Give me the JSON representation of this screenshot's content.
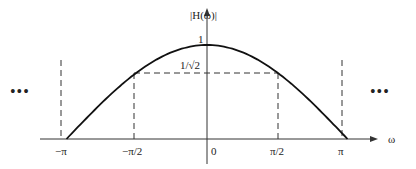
{
  "chart_data": {
    "type": "line",
    "title": "",
    "xlabel": "ω",
    "ylabel": "|H(ω)|",
    "function": "|H(ω)| = |cos(ω/2)|",
    "x_ticks": [
      "−π",
      "−π/2",
      "0",
      "π/2",
      "π"
    ],
    "y_ticks": [
      "1",
      "1/√2"
    ],
    "series": [
      {
        "name": "|H(ω)|",
        "x": [
          -3.1416,
          -2.3562,
          -1.5708,
          -0.7854,
          0,
          0.7854,
          1.5708,
          2.3562,
          3.1416
        ],
        "values": [
          0,
          0.383,
          0.707,
          0.924,
          1,
          0.924,
          0.707,
          0.383,
          0
        ]
      }
    ],
    "xlim": [
      -3.1416,
      3.1416
    ],
    "ylim": [
      0,
      1
    ],
    "annotations": [
      "dashed lines at ω=±π/2 to 1/√2",
      "dashed verticals at ω=±π",
      "… ellipses indicating periodic continuation"
    ],
    "grid": false
  },
  "labels": {
    "ylabel": "|H(ω)|",
    "xlabel": "ω",
    "one": "1",
    "inv_sqrt2": "1/√2",
    "neg_pi": "−π",
    "neg_pi_2": "−π/2",
    "zero": "0",
    "pi_2": "π/2",
    "pi": "π",
    "ellipsis_left": "•••",
    "ellipsis_right": "•••"
  }
}
